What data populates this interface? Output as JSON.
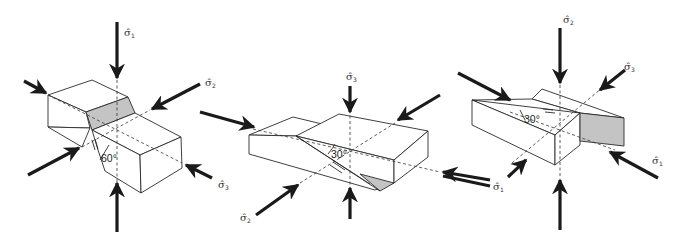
{
  "figures": [
    {
      "id": "normal-fault",
      "angle_label": "60°",
      "labels": [
        {
          "sym": "σ̂",
          "sub": "1"
        },
        {
          "sym": "σ̂",
          "sub": "2"
        },
        {
          "sym": "σ̂",
          "sub": "3"
        }
      ]
    },
    {
      "id": "strike-slip-fault",
      "angle_label": "30°",
      "labels": [
        {
          "sym": "σ̂",
          "sub": "3"
        },
        {
          "sym": "σ̂",
          "sub": "2"
        },
        {
          "sym": "σ̂",
          "sub": "1"
        }
      ]
    },
    {
      "id": "thrust-fault",
      "angle_label": "30°",
      "labels": [
        {
          "sym": "σ̂",
          "sub": "2"
        },
        {
          "sym": "σ̂",
          "sub": "3"
        },
        {
          "sym": "σ̂",
          "sub": "1"
        }
      ]
    }
  ],
  "colors": {
    "line": "#2a2a2a",
    "arrow": "#1a1a1a",
    "fault_plane": "#c4c4c4",
    "background": "#ffffff"
  }
}
